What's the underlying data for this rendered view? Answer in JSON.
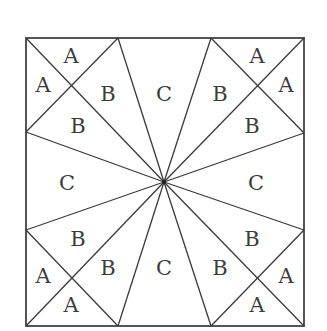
{
  "diagram": {
    "colors": {
      "line": "#3a3a3a",
      "frame": "#555555",
      "label": "#3c3c3c",
      "background": "#ffffff"
    },
    "square": {
      "x1": 26,
      "y1": 38,
      "x2": 304,
      "y2": 326
    },
    "center": {
      "x": 164,
      "y": 182
    },
    "boundary_points": {
      "top_left_inner": {
        "x": 118,
        "y": 38
      },
      "top_right_inner": {
        "x": 211,
        "y": 38
      },
      "right_upper": {
        "x": 304,
        "y": 133
      },
      "right_lower": {
        "x": 304,
        "y": 230
      },
      "bottom_right_inner": {
        "x": 211,
        "y": 326
      },
      "bottom_left_inner": {
        "x": 118,
        "y": 326
      },
      "left_lower": {
        "x": 26,
        "y": 230
      },
      "left_upper": {
        "x": 26,
        "y": 132
      }
    },
    "labels": [
      {
        "text": "A",
        "x": 71,
        "y": 56
      },
      {
        "text": "A",
        "x": 43,
        "y": 85
      },
      {
        "text": "B",
        "x": 108,
        "y": 94
      },
      {
        "text": "B",
        "x": 78,
        "y": 126
      },
      {
        "text": "C",
        "x": 164,
        "y": 94
      },
      {
        "text": "B",
        "x": 220,
        "y": 94
      },
      {
        "text": "A",
        "x": 257,
        "y": 56
      },
      {
        "text": "A",
        "x": 286,
        "y": 85
      },
      {
        "text": "B",
        "x": 252,
        "y": 126
      },
      {
        "text": "C",
        "x": 67,
        "y": 183
      },
      {
        "text": "C",
        "x": 256,
        "y": 183
      },
      {
        "text": "B",
        "x": 78,
        "y": 239
      },
      {
        "text": "B",
        "x": 108,
        "y": 268
      },
      {
        "text": "A",
        "x": 43,
        "y": 276
      },
      {
        "text": "A",
        "x": 71,
        "y": 305
      },
      {
        "text": "C",
        "x": 164,
        "y": 268
      },
      {
        "text": "B",
        "x": 220,
        "y": 268
      },
      {
        "text": "B",
        "x": 252,
        "y": 239
      },
      {
        "text": "A",
        "x": 286,
        "y": 276
      },
      {
        "text": "A",
        "x": 257,
        "y": 305
      }
    ]
  }
}
